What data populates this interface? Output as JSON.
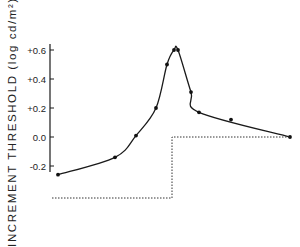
{
  "chart_data": {
    "type": "line",
    "title": "",
    "xlabel": "",
    "ylabel": "INCREMENT THRESHOLD (log cd/m²)",
    "ylim": [
      -0.3,
      0.65
    ],
    "yticks": [
      0.6,
      0.4,
      0.2,
      0.0,
      -0.2
    ],
    "ytick_labels": [
      "+0.6",
      "+0.4",
      "+0.2",
      "0.0",
      "-0.2"
    ],
    "grid": false,
    "legend": null,
    "series": [
      {
        "name": "increment threshold (measured)",
        "style": "points with smooth curve",
        "x_px": [
          58,
          115,
          136,
          156,
          167,
          174,
          178,
          191,
          199,
          231,
          290
        ],
        "values": [
          -0.26,
          -0.14,
          0.01,
          0.2,
          0.5,
          0.6,
          0.6,
          0.31,
          0.17,
          0.12,
          0.0
        ]
      },
      {
        "name": "background step (stimulus)",
        "style": "dotted step",
        "description": "low level until step onset, then steps up to 0.0 level",
        "step_x_px": 172
      }
    ]
  },
  "axis": {
    "ylabel": "INCREMENT THRESHOLD (log cd/m²)"
  }
}
